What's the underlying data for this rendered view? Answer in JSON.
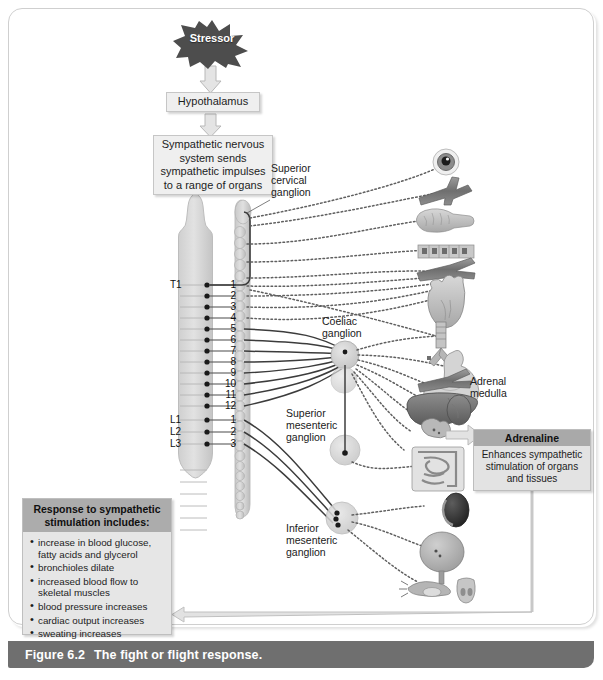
{
  "figure": {
    "number": "Figure 6.2",
    "caption": "The fight or flight response."
  },
  "flow": {
    "stressor": "Stressor",
    "hypothalamus": "Hypothalamus",
    "sns": "Sympathetic nervous system sends sympathetic impulses to a range of organs"
  },
  "labels": {
    "superior_cervical_ganglion": "Superior\ncervical\nganglion",
    "superior_cervical_ganglion_lines": [
      "Superior",
      "cervical",
      "ganglion"
    ],
    "coeliac_ganglion_lines": [
      "Coeliac",
      "ganglion"
    ],
    "superior_mesenteric_ganglion_lines": [
      "Superior",
      "mesenteric",
      "ganglion"
    ],
    "inferior_mesenteric_ganglion_lines": [
      "Inferior",
      "mesenteric",
      "ganglion"
    ],
    "adrenal_medulla_lines": [
      "Adrenal",
      "medulla"
    ]
  },
  "spinal_levels": {
    "thoracic_marker": "T1",
    "lumbar_markers": [
      "L1",
      "L2",
      "L3"
    ],
    "thoracic_numbers": [
      "1",
      "2",
      "3",
      "4",
      "5",
      "6",
      "7",
      "8",
      "9",
      "10",
      "11",
      "12"
    ],
    "lumbar_numbers": [
      "1",
      "2",
      "3"
    ]
  },
  "adrenaline": {
    "title": "Adrenaline",
    "body": "Enhances sympathetic stimulation of organs and tissues"
  },
  "response": {
    "title": "Response to sympathetic stimulation includes:",
    "items": [
      "increase in blood glucose, fatty acids and glycerol",
      "bronchioles dilate",
      "increased blood flow to skeletal muscles",
      "blood pressure increases",
      "cardiac output increases",
      "sweating increases"
    ]
  },
  "organs": [
    "eye",
    "blood-vessels-upper",
    "salivary-gland",
    "skin-sweat-gland",
    "blood-vessels-skeletal-muscle",
    "heart",
    "lungs",
    "stomach",
    "blood-vessels-abdominal",
    "liver",
    "kidney-upper",
    "adrenal-gland",
    "intestines",
    "kidney-lower",
    "bladder",
    "reproductive-organs"
  ],
  "colors": {
    "stressor_fill": "#4d4d4d",
    "stressor_text": "#ffffff",
    "box_fill": "#efefef",
    "box_border": "#c6c6c6",
    "adrenaline_header": "#a9a9a9",
    "response_header": "#acacac",
    "caption_bar": "#6f6f6f",
    "caption_text": "#ffffff",
    "spinal_cord": "#d6d6d6",
    "chain_fill": "#d2d2d2",
    "nerve_solid": "#4a4a4a",
    "nerve_dotted": "#6b6b6b",
    "arrow_fill": "#e0e0e0",
    "arrow_stroke": "#b0b0b0"
  }
}
